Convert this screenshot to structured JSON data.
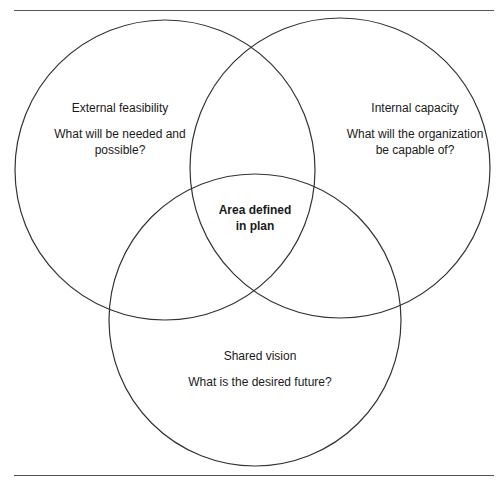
{
  "diagram": {
    "type": "venn",
    "circles": [
      {
        "id": "external",
        "title": "External feasibility",
        "question": "What will be needed and possible?",
        "question_lines": [
          "What will be needed and",
          "possible?"
        ]
      },
      {
        "id": "internal",
        "title": "Internal capacity",
        "question": "What will the organization be capable of?",
        "question_lines": [
          "What will the organization",
          "be capable of?"
        ]
      },
      {
        "id": "shared",
        "title": "Shared vision",
        "question": "What is the desired future?",
        "question_lines": [
          "What is the desired future?"
        ]
      }
    ],
    "intersection": {
      "line1": "Area defined",
      "line2": "in plan"
    },
    "stroke_color": "#333333"
  }
}
